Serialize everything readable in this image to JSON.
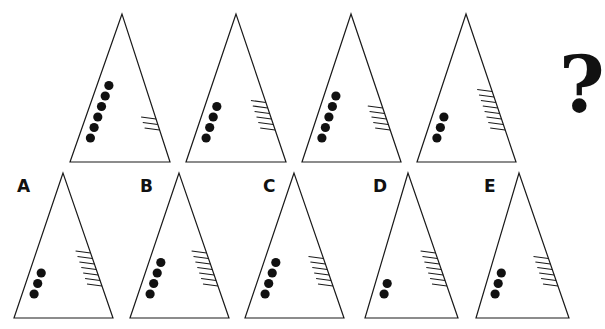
{
  "puzzle": {
    "sequence": [
      {
        "index": 1,
        "dots": 6,
        "lines": 3,
        "apex": [
          122,
          14
        ],
        "base": [
          70,
          162,
          170,
          162
        ]
      },
      {
        "index": 2,
        "dots": 4,
        "lines": 6,
        "apex": [
          236,
          14
        ],
        "base": [
          186,
          162,
          286,
          162
        ]
      },
      {
        "index": 3,
        "dots": 5,
        "lines": 5,
        "apex": [
          351,
          14
        ],
        "base": [
          302,
          162,
          401,
          162
        ]
      },
      {
        "index": 4,
        "dots": 3,
        "lines": 8,
        "apex": [
          466,
          14
        ],
        "base": [
          417,
          162,
          516,
          162
        ]
      }
    ],
    "question_mark": "?",
    "options": [
      {
        "label": "A",
        "dots": 3,
        "lines": 7,
        "apex": [
          63,
          173
        ],
        "base": [
          14,
          318,
          113,
          318
        ],
        "label_pos": [
          17,
          176
        ]
      },
      {
        "label": "B",
        "dots": 4,
        "lines": 7,
        "apex": [
          179,
          173
        ],
        "base": [
          130,
          318,
          229,
          318
        ],
        "label_pos": [
          140,
          176
        ]
      },
      {
        "label": "C",
        "dots": 4,
        "lines": 6,
        "apex": [
          294,
          173
        ],
        "base": [
          245,
          318,
          344,
          318
        ],
        "label_pos": [
          263,
          176
        ]
      },
      {
        "label": "D",
        "dots": 2,
        "lines": 7,
        "apex": [
          408,
          173
        ],
        "base": [
          365,
          318,
          458,
          318
        ],
        "label_pos": [
          373,
          176
        ]
      },
      {
        "label": "E",
        "dots": 3,
        "lines": 6,
        "apex": [
          519,
          173
        ],
        "base": [
          476,
          318,
          569,
          318
        ],
        "label_pos": [
          484,
          176
        ]
      }
    ]
  },
  "colors": {
    "ink": "#111111",
    "background": "#ffffff"
  }
}
